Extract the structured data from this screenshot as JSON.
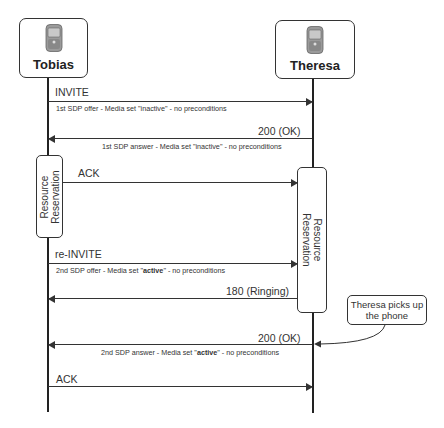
{
  "actors": {
    "left": {
      "name": "Tobias",
      "icon": "mobile-phone-icon"
    },
    "right": {
      "name": "Theresa",
      "icon": "mobile-phone-icon"
    }
  },
  "messages": [
    {
      "label": "INVITE",
      "direction": "right",
      "sub_pre": "1st SDP offer - Media set \"",
      "sub_bold": "",
      "sub_plain_value": "inactive",
      "sub_post": "\" - no preconditions"
    },
    {
      "label": "200 (OK)",
      "direction": "left",
      "sub_pre": "1st SDP answer - Media set \"",
      "sub_bold": "",
      "sub_plain_value": "inactive",
      "sub_post": "\" - no preconditions"
    },
    {
      "label": "ACK",
      "direction": "right"
    },
    {
      "label": "re-INVITE",
      "direction": "right",
      "sub_pre": "2nd SDP offer - Media set \"",
      "sub_bold": "active",
      "sub_post": "\" - no preconditions"
    },
    {
      "label": "180 (Ringing)",
      "direction": "left"
    },
    {
      "label": "200 (OK)",
      "direction": "left",
      "sub_pre": "2nd SDP answer - Media set \"",
      "sub_bold": "active",
      "sub_post": "\" - no preconditions"
    },
    {
      "label": "ACK",
      "direction": "right"
    }
  ],
  "resource_reservation": {
    "left": {
      "line1": "Resource",
      "line2": "Reservation"
    },
    "right": {
      "line1": "Resource",
      "line2": "Reservation"
    }
  },
  "callout": {
    "line1": "Theresa picks up",
    "line2": "the phone"
  }
}
